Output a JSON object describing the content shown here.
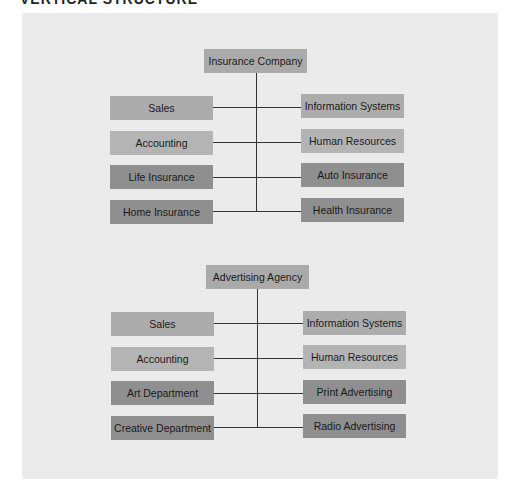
{
  "header": {
    "visible_fragment": "VERTICAL STRUCTURE",
    "trailing_fragment": "(cont.)"
  },
  "colors": {
    "background": "#ebebeb",
    "root_box": "#aaaaaa",
    "staff_box": "#acacac",
    "staff_box_alt": "#b4b4b4",
    "line_box": "#8f8f8f",
    "connector": "#333333"
  },
  "charts": [
    {
      "root": "Insurance Company",
      "left": [
        "Sales",
        "Accounting",
        "Life Insurance",
        "Home Insurance"
      ],
      "right": [
        "Information Systems",
        "Human Resources",
        "Auto Insurance",
        "Health Insurance"
      ]
    },
    {
      "root": "Advertising Agency",
      "left": [
        "Sales",
        "Accounting",
        "Art Department",
        "Creative Department"
      ],
      "right": [
        "Information Systems",
        "Human Resources",
        "Print Advertising",
        "Radio Advertising"
      ]
    }
  ]
}
